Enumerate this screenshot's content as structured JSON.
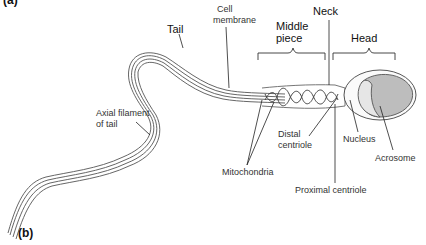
{
  "figure": {
    "panel_top": "(a)",
    "panel_bottom": "(b)"
  },
  "labels": {
    "tail": "Tail",
    "cell_membrane_1": "Cell",
    "cell_membrane_2": "membrane",
    "middle_piece_1": "Middle",
    "middle_piece_2": "piece",
    "neck": "Neck",
    "head": "Head",
    "axial_filament_1": "Axial filament",
    "axial_filament_2": "of tail",
    "distal_centriole_1": "Distal",
    "distal_centriole_2": "centriole",
    "nucleus": "Nucleus",
    "acrosome": "Acrosome",
    "mitochondria": "Mitochondria",
    "proximal_centriole": "Proximal centriole"
  }
}
